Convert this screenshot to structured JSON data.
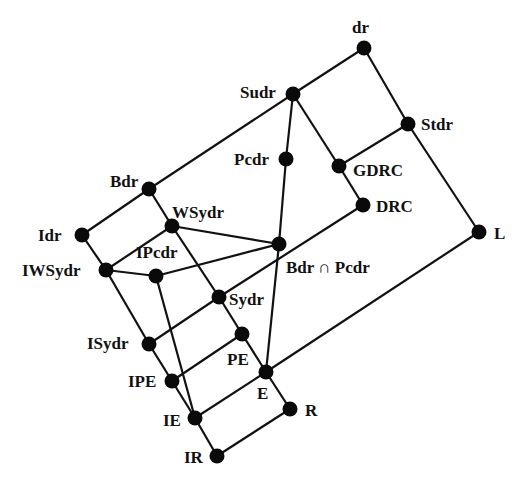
{
  "diagram": {
    "type": "lattice",
    "nodes": [
      {
        "id": "dr",
        "label": "dr",
        "x": 364,
        "y": 48,
        "lx": 352,
        "ly": 33
      },
      {
        "id": "Sudr",
        "label": "Sudr",
        "x": 293,
        "y": 94,
        "lx": 240,
        "ly": 98
      },
      {
        "id": "Stdr",
        "label": "Stdr",
        "x": 408,
        "y": 124,
        "lx": 421,
        "ly": 130
      },
      {
        "id": "Pcdr",
        "label": "Pcdr",
        "x": 286,
        "y": 159,
        "lx": 234,
        "ly": 165
      },
      {
        "id": "GDRC",
        "label": "GDRC",
        "x": 339,
        "y": 166,
        "lx": 353,
        "ly": 176
      },
      {
        "id": "Bdr",
        "label": "Bdr",
        "x": 149,
        "y": 189,
        "lx": 110,
        "ly": 187
      },
      {
        "id": "DRC",
        "label": "DRC",
        "x": 363,
        "y": 205,
        "lx": 376,
        "ly": 212
      },
      {
        "id": "WSydr",
        "label": "WSydr",
        "x": 172,
        "y": 226,
        "lx": 172,
        "ly": 218
      },
      {
        "id": "Idr",
        "label": "Idr",
        "x": 82,
        "y": 235,
        "lx": 38,
        "ly": 241
      },
      {
        "id": "L",
        "label": "L",
        "x": 479,
        "y": 232,
        "lx": 494,
        "ly": 239
      },
      {
        "id": "BdrPcdr",
        "label": "Bdr ∩ Pcdr",
        "x": 279,
        "y": 244,
        "lx": 286,
        "ly": 273
      },
      {
        "id": "IWSydr",
        "label": "IWSydr",
        "x": 106,
        "y": 270,
        "lx": 22,
        "ly": 276
      },
      {
        "id": "IPcdr",
        "label": "IPcdr",
        "x": 156,
        "y": 276,
        "lx": 136,
        "ly": 258
      },
      {
        "id": "Sydr",
        "label": "Sydr",
        "x": 219,
        "y": 297,
        "lx": 229,
        "ly": 305
      },
      {
        "id": "ISydr",
        "label": "ISydr",
        "x": 149,
        "y": 344,
        "lx": 87,
        "ly": 349
      },
      {
        "id": "PE",
        "label": "PE",
        "x": 242,
        "y": 334,
        "lx": 227,
        "ly": 365
      },
      {
        "id": "E",
        "label": "E",
        "x": 266,
        "y": 372,
        "lx": 257,
        "ly": 399
      },
      {
        "id": "IPE",
        "label": "IPE",
        "x": 172,
        "y": 381,
        "lx": 128,
        "ly": 387
      },
      {
        "id": "R",
        "label": "R",
        "x": 290,
        "y": 409,
        "lx": 305,
        "ly": 416
      },
      {
        "id": "IE",
        "label": "IE",
        "x": 195,
        "y": 418,
        "lx": 163,
        "ly": 426
      },
      {
        "id": "IR",
        "label": "IR",
        "x": 217,
        "y": 456,
        "lx": 184,
        "ly": 463
      }
    ],
    "edges": [
      [
        "dr",
        "Sudr"
      ],
      [
        "dr",
        "Stdr"
      ],
      [
        "Sudr",
        "Bdr"
      ],
      [
        "Sudr",
        "Pcdr"
      ],
      [
        "Sudr",
        "GDRC"
      ],
      [
        "Stdr",
        "GDRC"
      ],
      [
        "Stdr",
        "L"
      ],
      [
        "GDRC",
        "DRC"
      ],
      [
        "Pcdr",
        "BdrPcdr"
      ],
      [
        "Bdr",
        "Idr"
      ],
      [
        "Bdr",
        "WSydr"
      ],
      [
        "Idr",
        "IWSydr"
      ],
      [
        "WSydr",
        "IWSydr"
      ],
      [
        "WSydr",
        "BdrPcdr"
      ],
      [
        "WSydr",
        "Sydr"
      ],
      [
        "DRC",
        "Sydr"
      ],
      [
        "BdrPcdr",
        "IPcdr"
      ],
      [
        "BdrPcdr",
        "E"
      ],
      [
        "IWSydr",
        "IPcdr"
      ],
      [
        "IWSydr",
        "ISydr"
      ],
      [
        "IPcdr",
        "IE"
      ],
      [
        "Sydr",
        "ISydr"
      ],
      [
        "Sydr",
        "PE"
      ],
      [
        "L",
        "E"
      ],
      [
        "ISydr",
        "IPE"
      ],
      [
        "PE",
        "IPE"
      ],
      [
        "PE",
        "E"
      ],
      [
        "IPE",
        "IE"
      ],
      [
        "E",
        "IE"
      ],
      [
        "E",
        "R"
      ],
      [
        "IE",
        "IR"
      ],
      [
        "R",
        "IR"
      ]
    ],
    "node_radius": 7.5,
    "colors": {
      "node": "#0a0a0a",
      "edge": "#111111",
      "background": "#ffffff"
    }
  }
}
